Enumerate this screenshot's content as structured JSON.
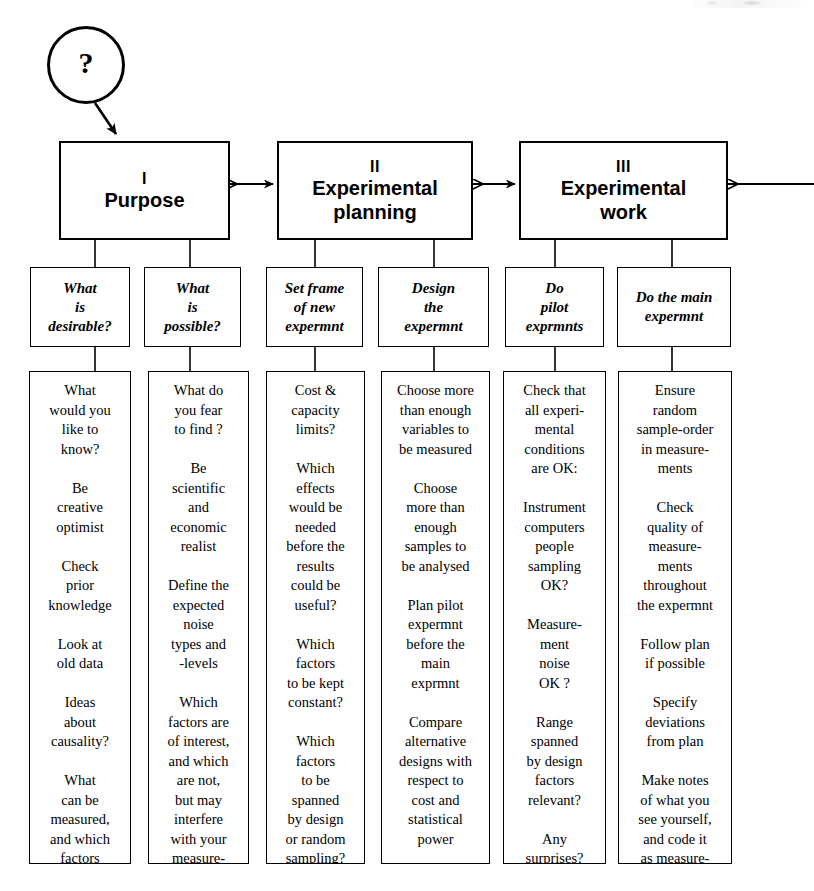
{
  "diagram": {
    "start_node": {
      "label": "?"
    },
    "phases": [
      {
        "numeral": "I",
        "title": "Purpose"
      },
      {
        "numeral": "II",
        "title": "Experimental\nplanning"
      },
      {
        "numeral": "III",
        "title": "Experimental\nwork"
      }
    ],
    "tasks": [
      {
        "label": "What\nis\ndesirable?"
      },
      {
        "label": "What\nis\npossible?"
      },
      {
        "label": "Set frame\nof new\nexpermnt"
      },
      {
        "label": "Design\nthe\nexpermnt"
      },
      {
        "label": "Do\npilot\nexprmnts"
      },
      {
        "label": "Do the main\nexpermnt"
      }
    ],
    "details": [
      {
        "text": "What\nwould you\nlike to\nknow?\n\nBe\ncreative\noptimist\n\nCheck\nprior\nknowledge\n\nLook at\nold data\n\nIdeas\nabout\ncausality?\n\nWhat\ncan be\nmeasured,\nand which\nfactors\naffect it?"
      },
      {
        "text": "What do\nyou fear\nto find ?\n\nBe\nscientific\nand\neconomic\nrealist\n\nDefine the\nexpected\nnoise\ntypes and\n-levels\n\nWhich\nfactors are\nof interest,\nand which\nare not,\nbut may\ninterfere\nwith your\nmeasure-\nments?"
      },
      {
        "text": "Cost &\ncapacity\nlimits?\n\nWhich\neffects\nwould be\nneeded\nbefore the\nresults\ncould be\nuseful?\n\nWhich\nfactors\nto be kept\nconstant?\n\nWhich\nfactors\nto be\nspanned\nby design\nor  random\nsampling?"
      },
      {
        "text": "Choose more\nthan enough\nvariables to\nbe measured\n\nChoose\nmore than\nenough\nsamples to\nbe analysed\n\nPlan  pilot\nexpermnt\nbefore the\nmain\nexprmnt\n\nCompare\nalternative\ndesigns with\nrespect to\ncost and\nstatistical\npower"
      },
      {
        "text": "Check that\nall experi-\nmental\nconditions\nare OK:\n\nInstrument\ncomputers\npeople\nsampling\nOK?\n\nMeasure-\nment\nnoise\nOK ?\n\nRange\nspanned\nby design\nfactors\nrelevant?\n\nAny\nsurprises?"
      },
      {
        "text": "Ensure\nrandom\nsample-order\nin measure-\nments\n\nCheck\nquality of\nmeasure-\nments\nthroughout\nthe expermnt\n\nFollow plan\nif possible\n\nSpecify\ndeviations\nfrom plan\n\nMake notes\nof what you\nsee yourself,\nand code it\nas  measure-\nments"
      }
    ],
    "colors": {
      "stroke": "#000000",
      "background": "#ffffff"
    }
  }
}
